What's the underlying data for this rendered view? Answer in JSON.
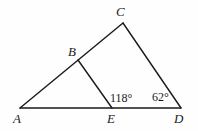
{
  "figure": {
    "kind": "geometry-diagram",
    "background_color": "#fefefe",
    "stroke_color": "#1a1a1a",
    "stroke_width": 1.4,
    "width": 198,
    "height": 131
  },
  "points": {
    "A": {
      "label": "A",
      "x": 20,
      "y": 108,
      "label_x": 13,
      "label_y": 112
    },
    "B": {
      "label": "B",
      "x": 78,
      "y": 60,
      "label_x": 68,
      "label_y": 45
    },
    "C": {
      "label": "C",
      "x": 123,
      "y": 23,
      "label_x": 116,
      "label_y": 5
    },
    "D": {
      "label": "D",
      "x": 181,
      "y": 108,
      "label_x": 174,
      "label_y": 112
    },
    "E": {
      "label": "E",
      "x": 112,
      "y": 108,
      "label_x": 107,
      "label_y": 112
    }
  },
  "segments": [
    {
      "name": "segment-AD-baseline",
      "from": "A",
      "to": "D"
    },
    {
      "name": "segment-AC",
      "from": "A",
      "to": "C"
    },
    {
      "name": "segment-CD",
      "from": "C",
      "to": "D"
    },
    {
      "name": "segment-BE",
      "from": "B",
      "to": "E"
    }
  ],
  "angles": [
    {
      "name": "angle-at-E",
      "text": "118°",
      "value": 118,
      "vertex": "E",
      "label_x": 110,
      "label_y": 92
    },
    {
      "name": "angle-at-D",
      "text": "62°",
      "value": 62,
      "vertex": "D",
      "label_x": 152,
      "label_y": 91
    }
  ]
}
